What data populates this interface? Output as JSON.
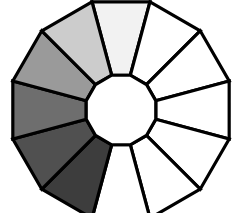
{
  "figure": {
    "name": "grayscale-segmented-ring",
    "background_color": "#ffffff",
    "outline_color": "#000000",
    "outline_width": 3.2,
    "hub_color": "#ffffff",
    "segment_count": 12
  },
  "geometry": {
    "center_x": 121,
    "center_y": 110,
    "outer_radius": 112,
    "inner_radius": 36,
    "start_angle_deg": -105,
    "sides": 12
  },
  "chart_data": {
    "type": "pie",
    "xlabel": "",
    "ylabel": "",
    "legend": "none",
    "grid": false,
    "categories": [
      "segment-1",
      "segment-2",
      "segment-3",
      "segment-4",
      "segment-5",
      "segment-6",
      "segment-7",
      "segment-8",
      "segment-9",
      "segment-10",
      "segment-11",
      "segment-12"
    ],
    "values": [
      1,
      1,
      1,
      1,
      1,
      1,
      1,
      1,
      1,
      1,
      1,
      1
    ],
    "colors": [
      "#f2f2f2",
      "#ffffff",
      "#ffffff",
      "#ffffff",
      "#ffffff",
      "#ffffff",
      "#ffffff",
      "#3d3d3d",
      "#505050",
      "#6e6e6e",
      "#9a9a9a",
      "#cccccc"
    ]
  },
  "segments": [
    {
      "index": 1,
      "name": "segment-top",
      "fill": "#f2f2f2"
    },
    {
      "index": 2,
      "name": "segment-upper-right",
      "fill": "#ffffff"
    },
    {
      "index": 3,
      "name": "segment-right-upper",
      "fill": "#ffffff"
    },
    {
      "index": 4,
      "name": "segment-right",
      "fill": "#ffffff"
    },
    {
      "index": 5,
      "name": "segment-right-lower",
      "fill": "#ffffff"
    },
    {
      "index": 6,
      "name": "segment-lower-right",
      "fill": "#ffffff"
    },
    {
      "index": 7,
      "name": "segment-bottom",
      "fill": "#ffffff"
    },
    {
      "index": 8,
      "name": "segment-lower-left",
      "fill": "#3d3d3d"
    },
    {
      "index": 9,
      "name": "segment-left-lower",
      "fill": "#505050"
    },
    {
      "index": 10,
      "name": "segment-left",
      "fill": "#6e6e6e"
    },
    {
      "index": 11,
      "name": "segment-left-upper",
      "fill": "#9a9a9a"
    },
    {
      "index": 12,
      "name": "segment-upper-left",
      "fill": "#cccccc"
    }
  ]
}
